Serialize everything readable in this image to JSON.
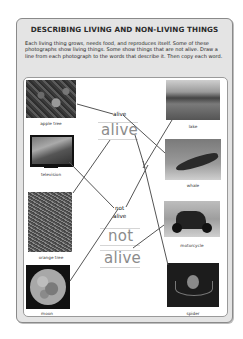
{
  "worksheet": {
    "title": "DESCRIBING LIVING AND NON-LIVING THINGS",
    "instructions": "Each living thing grows, needs food, and reproduces itself. Some of these photographs show living things. Some show things that are not alive. Draw a line from each photograph to the words that describe it. Then copy each word."
  },
  "photos_left": [
    {
      "caption": "apple tree"
    },
    {
      "caption": "television"
    },
    {
      "caption": "orange tree"
    },
    {
      "caption": "moon"
    }
  ],
  "photos_right": [
    {
      "caption": "lake"
    },
    {
      "caption": "whale"
    },
    {
      "caption": "motorcycle"
    },
    {
      "caption": "spider"
    }
  ],
  "words": {
    "alive_label": "alive",
    "alive_trace": "alive",
    "not_alive_label_line1": "not",
    "not_alive_label_line2": "alive",
    "not_trace": "not",
    "not_alive_trace": "alive"
  },
  "colors": {
    "frame_bg": "#e4e4e4",
    "line": "#555555",
    "trace_text": "#8c8c8c"
  }
}
